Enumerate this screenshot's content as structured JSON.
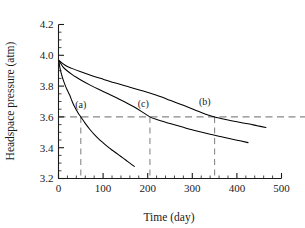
{
  "chart_data": {
    "type": "line",
    "title": "",
    "xlabel": "Time (day)",
    "ylabel": "Headspace pressure (atm)",
    "xlim": [
      0,
      500
    ],
    "ylim": [
      3.2,
      4.2
    ],
    "xticks": [
      0,
      100,
      200,
      300,
      400,
      500
    ],
    "xtick_labels": [
      "0",
      "100",
      "200",
      "300",
      "400",
      "500"
    ],
    "yticks": [
      3.2,
      3.4,
      3.6,
      3.8,
      4.0,
      4.2
    ],
    "ytick_labels": [
      "3.2",
      "3.4",
      "3.6",
      "3.8",
      "4.0",
      "4.2"
    ],
    "x_minor_tick_interval": 20,
    "y_minor_tick_interval": 0.05,
    "grid": false,
    "legend": "none",
    "spines": [
      "left",
      "bottom"
    ],
    "line_color": "#000000",
    "dash_color": "#888888",
    "background": "#ffffff",
    "series": [
      {
        "name": "(a)",
        "label": "(a)",
        "label_x": 50,
        "label_y": 3.655,
        "crosses_3p6_at_day": 50,
        "points": [
          {
            "x": 0,
            "y": 3.97
          },
          {
            "x": 5,
            "y": 3.895
          },
          {
            "x": 10,
            "y": 3.845
          },
          {
            "x": 15,
            "y": 3.805
          },
          {
            "x": 20,
            "y": 3.772
          },
          {
            "x": 25,
            "y": 3.742
          },
          {
            "x": 30,
            "y": 3.705
          },
          {
            "x": 35,
            "y": 3.672
          },
          {
            "x": 40,
            "y": 3.645
          },
          {
            "x": 45,
            "y": 3.62
          },
          {
            "x": 50,
            "y": 3.6
          },
          {
            "x": 60,
            "y": 3.558
          },
          {
            "x": 70,
            "y": 3.52
          },
          {
            "x": 80,
            "y": 3.487
          },
          {
            "x": 90,
            "y": 3.458
          },
          {
            "x": 100,
            "y": 3.432
          },
          {
            "x": 110,
            "y": 3.407
          },
          {
            "x": 120,
            "y": 3.385
          },
          {
            "x": 130,
            "y": 3.364
          },
          {
            "x": 140,
            "y": 3.343
          },
          {
            "x": 150,
            "y": 3.322
          },
          {
            "x": 160,
            "y": 3.3
          },
          {
            "x": 170,
            "y": 3.279
          }
        ]
      },
      {
        "name": "(c)",
        "label": "(c)",
        "label_x": 190,
        "label_y": 3.662,
        "crosses_3p6_at_day": 205,
        "points": [
          {
            "x": 0,
            "y": 3.97
          },
          {
            "x": 10,
            "y": 3.925
          },
          {
            "x": 20,
            "y": 3.898
          },
          {
            "x": 30,
            "y": 3.876
          },
          {
            "x": 40,
            "y": 3.857
          },
          {
            "x": 50,
            "y": 3.84
          },
          {
            "x": 70,
            "y": 3.808
          },
          {
            "x": 90,
            "y": 3.779
          },
          {
            "x": 110,
            "y": 3.752
          },
          {
            "x": 130,
            "y": 3.724
          },
          {
            "x": 150,
            "y": 3.695
          },
          {
            "x": 170,
            "y": 3.664
          },
          {
            "x": 190,
            "y": 3.628
          },
          {
            "x": 205,
            "y": 3.6
          },
          {
            "x": 220,
            "y": 3.583
          },
          {
            "x": 250,
            "y": 3.557
          },
          {
            "x": 280,
            "y": 3.532
          },
          {
            "x": 310,
            "y": 3.508
          },
          {
            "x": 340,
            "y": 3.487
          },
          {
            "x": 370,
            "y": 3.468
          },
          {
            "x": 400,
            "y": 3.449
          },
          {
            "x": 425,
            "y": 3.433
          }
        ]
      },
      {
        "name": "(b)",
        "label": "(b)",
        "label_x": 328,
        "label_y": 3.676,
        "crosses_3p6_at_day": 350,
        "points": [
          {
            "x": 0,
            "y": 3.97
          },
          {
            "x": 15,
            "y": 3.935
          },
          {
            "x": 30,
            "y": 3.915
          },
          {
            "x": 50,
            "y": 3.893
          },
          {
            "x": 75,
            "y": 3.868
          },
          {
            "x": 100,
            "y": 3.845
          },
          {
            "x": 130,
            "y": 3.818
          },
          {
            "x": 160,
            "y": 3.793
          },
          {
            "x": 190,
            "y": 3.768
          },
          {
            "x": 220,
            "y": 3.74
          },
          {
            "x": 250,
            "y": 3.708
          },
          {
            "x": 280,
            "y": 3.675
          },
          {
            "x": 310,
            "y": 3.64
          },
          {
            "x": 330,
            "y": 3.618
          },
          {
            "x": 350,
            "y": 3.6
          },
          {
            "x": 375,
            "y": 3.583
          },
          {
            "x": 400,
            "y": 3.568
          },
          {
            "x": 425,
            "y": 3.555
          },
          {
            "x": 445,
            "y": 3.543
          },
          {
            "x": 465,
            "y": 3.531
          }
        ]
      }
    ],
    "annotations": {
      "threshold_line": {
        "type": "horizontal-dashed",
        "y": 3.6,
        "x_start": 0,
        "x_end": 560
      },
      "drop_lines": [
        {
          "type": "vertical-dashed",
          "x": 50,
          "y_top": 3.6,
          "y_bottom": 3.2,
          "for": "(a)"
        },
        {
          "type": "vertical-dashed",
          "x": 205,
          "y_top": 3.6,
          "y_bottom": 3.2,
          "for": "(c)"
        },
        {
          "type": "vertical-dashed",
          "x": 350,
          "y_top": 3.6,
          "y_bottom": 3.2,
          "for": "(b)"
        }
      ]
    }
  }
}
